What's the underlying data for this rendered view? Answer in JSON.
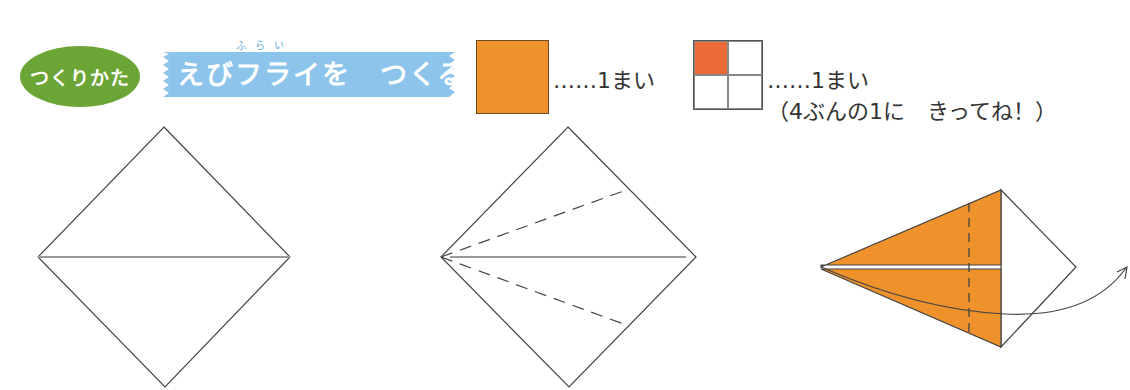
{
  "header": {
    "badge_label": "つくりかた",
    "title": "えびフライを　つくる",
    "title_ruby": "ふらい"
  },
  "materials": [
    {
      "name": "orange-paper",
      "color": "#f0922c",
      "quantity_label": "……1まい"
    },
    {
      "name": "quarter-paper",
      "color": "#ec6a35",
      "quantity_label": "……1まい",
      "note": "（4ぶんの1に　きってね！）"
    }
  ],
  "colors": {
    "badge_green": "#6aa535",
    "ribbon_blue": "#8cc4ec",
    "paper_orange": "#f0922c",
    "quarter_red": "#ec6a35",
    "line": "#444444",
    "crease": "#999999"
  },
  "steps": [
    {
      "id": 1,
      "description": "square diamond with horizontal center crease"
    },
    {
      "id": 2,
      "description": "diamond with two dashed valley folds from left corner to right edges"
    },
    {
      "id": 3,
      "description": "kite folded orange with dashed vertical fold line and arrow to turn over"
    }
  ]
}
